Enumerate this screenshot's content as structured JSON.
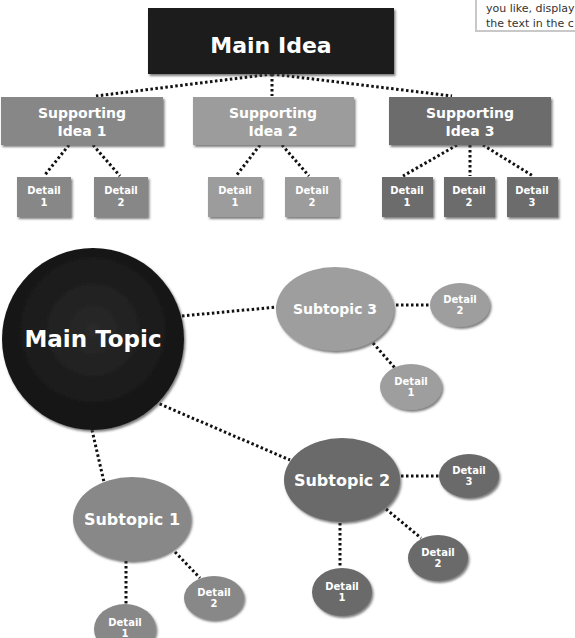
{
  "note": {
    "lines": [
      "you like, display",
      "the text in the c"
    ]
  },
  "hierarchy": {
    "main": {
      "label": "Main Idea",
      "color": "#1c1c1c"
    },
    "supporting": [
      {
        "line1": "Supporting",
        "line2": "Idea 1",
        "color": "#878787",
        "details": [
          {
            "line1": "Detail",
            "line2": "1"
          },
          {
            "line1": "Detail",
            "line2": "2"
          }
        ]
      },
      {
        "line1": "Supporting",
        "line2": "Idea 2",
        "color": "#9c9c9c",
        "details": [
          {
            "line1": "Detail",
            "line2": "1"
          },
          {
            "line1": "Detail",
            "line2": "2"
          }
        ]
      },
      {
        "line1": "Supporting",
        "line2": "Idea 3",
        "color": "#6c6c6c",
        "details": [
          {
            "line1": "Detail",
            "line2": "1"
          },
          {
            "line1": "Detail",
            "line2": "2"
          },
          {
            "line1": "Detail",
            "line2": "3"
          }
        ]
      }
    ]
  },
  "web": {
    "main": {
      "label": "Main Topic",
      "color": "#1a1a1a"
    },
    "subtopics": [
      {
        "label": "Subtopic 1",
        "color": "#888888",
        "details": [
          {
            "line1": "Detail",
            "line2": "1"
          },
          {
            "line1": "Detail",
            "line2": "2"
          }
        ]
      },
      {
        "label": "Subtopic 2",
        "color": "#6a6a6a",
        "details": [
          {
            "line1": "Detail",
            "line2": "1"
          },
          {
            "line1": "Detail",
            "line2": "2"
          },
          {
            "line1": "Detail",
            "line2": "3"
          }
        ]
      },
      {
        "label": "Subtopic 3",
        "color": "#9e9e9e",
        "details": [
          {
            "line1": "Detail",
            "line2": "1"
          },
          {
            "line1": "Detail",
            "line2": "2"
          }
        ]
      }
    ]
  },
  "colors": {
    "connector": "#111111",
    "text": "#ffffff",
    "shadow": "#555555"
  }
}
